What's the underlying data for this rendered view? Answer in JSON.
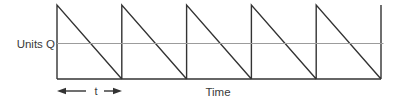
{
  "diagram": {
    "y_axis_label": "Units Q",
    "x_axis_label": "Time",
    "period_label": "t",
    "teeth_count": 5,
    "geometry": {
      "x_start": 57,
      "x_end": 381,
      "y_top": 5,
      "y_base": 79,
      "y_average_line": 43.5,
      "average_line_x_end": 383.5,
      "arrow_y": 91
    },
    "colors": {
      "waveform": "#333333",
      "baseline": "#333333",
      "average_line": "#9c9c9c",
      "arrow": "#333333",
      "text": "#3a3a3a",
      "background": "#ffffff"
    }
  }
}
